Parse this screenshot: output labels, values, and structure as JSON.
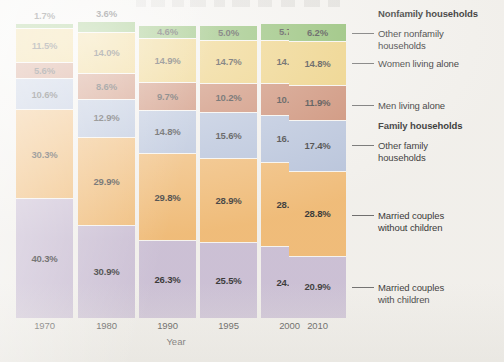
{
  "chart_data": {
    "type": "bar",
    "subtype": "stacked-100-percent",
    "title": "",
    "xlabel": "Year",
    "ylabel": "",
    "ylim": [
      0,
      100
    ],
    "grid": false,
    "legend_position": "right",
    "units": "percent",
    "categories": [
      "1970",
      "1980",
      "1990",
      "1995",
      "2000",
      "2010"
    ],
    "stack_order": "top-to-bottom",
    "series": [
      {
        "name": "Other nonfamily households",
        "group": "Nonfamily households",
        "color": "#79b155",
        "values": [
          1.7,
          3.6,
          4.6,
          5.0,
          5.7,
          6.2
        ],
        "labels": [
          "1.7%",
          "3.6%",
          "4.6%",
          "5.0%",
          "5.7%",
          "6.2%"
        ]
      },
      {
        "name": "Women living alone",
        "group": "Nonfamily households",
        "color": "#ebc96a",
        "values": [
          11.5,
          14.0,
          14.9,
          14.7,
          14.8,
          14.8
        ],
        "labels": [
          "11.5%",
          "14.0%",
          "14.9%",
          "14.7%",
          "14.8%",
          "14.8%"
        ]
      },
      {
        "name": "Men living alone",
        "group": "Nonfamily households",
        "color": "#c47a5c",
        "values": [
          5.6,
          8.6,
          9.7,
          10.2,
          10.7,
          11.9
        ],
        "labels": [
          "5.6%",
          "8.6%",
          "9.7%",
          "10.2%",
          "10.7%",
          "11.9%"
        ]
      },
      {
        "name": "Other family households",
        "group": "Family households",
        "color": "#aebcd8",
        "values": [
          10.6,
          12.9,
          14.8,
          15.6,
          16.0,
          17.4
        ],
        "labels": [
          "10.6%",
          "12.9%",
          "14.8%",
          "15.6%",
          "16.0%",
          "17.4%"
        ]
      },
      {
        "name": "Married couples without children",
        "group": "Family households",
        "color": "#f0b467",
        "values": [
          30.3,
          29.9,
          29.8,
          28.9,
          28.7,
          28.8
        ],
        "labels": [
          "30.3%",
          "29.9%",
          "29.8%",
          "28.9%",
          "28.7%",
          "28.8%"
        ]
      },
      {
        "name": "Married couples with children",
        "group": "Family households",
        "color": "#c6b9d2",
        "values": [
          40.3,
          30.9,
          26.3,
          25.5,
          24.1,
          20.9
        ],
        "labels": [
          "40.3%",
          "30.9%",
          "26.3%",
          "25.5%",
          "24.1%",
          "20.9%"
        ]
      }
    ]
  },
  "axis": {
    "x_title": "Year",
    "x_ticks": [
      "1970",
      "1980",
      "1990",
      "1995",
      "2000",
      "2010"
    ]
  },
  "legend": {
    "entries": [
      {
        "text": "Nonfamily households",
        "heading": true,
        "leader": false,
        "top": 8
      },
      {
        "text": "Other nonfamily\nhouseholds",
        "heading": false,
        "leader": true,
        "top": 28
      },
      {
        "text": "Women living alone",
        "heading": false,
        "leader": true,
        "top": 58
      },
      {
        "text": "Men living alone",
        "heading": false,
        "leader": true,
        "top": 100
      },
      {
        "text": "Family households",
        "heading": true,
        "leader": false,
        "top": 120
      },
      {
        "text": "Other family\nhouseholds",
        "heading": false,
        "leader": true,
        "top": 140
      },
      {
        "text": "Married couples\nwithout children",
        "heading": false,
        "leader": true,
        "top": 210
      },
      {
        "text": "Married couples\nwith children",
        "heading": false,
        "leader": true,
        "top": 282
      }
    ]
  },
  "colors": {
    "background": "#f2f0ec",
    "segment_gap": "#f7f5f1",
    "label_text": "#1b1b1b",
    "leader_line": "#5a5a5a",
    "other_nonfamily": "#79b155",
    "women_alone": "#ebc96a",
    "men_alone": "#c47a5c",
    "other_family": "#aebcd8",
    "married_no_children": "#f0b467",
    "married_with_children": "#c6b9d2"
  },
  "layout": {
    "bar_left_positions": [
      16,
      78,
      139,
      200,
      261,
      289
    ],
    "bar_width": 57,
    "plot_bottom_y": 318,
    "pixels_per_percent": 2.86
  }
}
